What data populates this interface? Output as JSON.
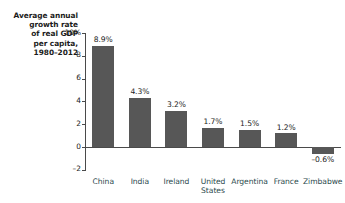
{
  "chart_data": {
    "type": "bar",
    "title": "Average annual growth rate of real GDP per capita, 1980–2012",
    "title_lines": [
      "Average annual",
      "growth rate",
      "of real GDP",
      "per capita,",
      "1980–2012"
    ],
    "categories": [
      "China",
      "India",
      "Ireland",
      "United States",
      "Argentina",
      "France",
      "Zimbabwe"
    ],
    "values": [
      8.9,
      4.3,
      3.2,
      1.7,
      1.5,
      1.2,
      -0.6
    ],
    "data_labels": [
      "8.9%",
      "4.3%",
      "3.2%",
      "1.7%",
      "1.5%",
      "1.2%",
      "–0.6%"
    ],
    "xlabel": "",
    "ylabel": "",
    "ylim": [
      -2,
      10
    ],
    "yticks": [
      10,
      8,
      6,
      4,
      2,
      0,
      -2
    ],
    "ytick_labels": [
      "10%",
      "8",
      "6",
      "4",
      "2",
      "0",
      "–2"
    ],
    "grid": false,
    "legend": false,
    "bar_color": "#575757",
    "axis_color": "#4a4a4a",
    "category_label_color": "#2b4a4d",
    "text_color": "#1b1b1b"
  }
}
